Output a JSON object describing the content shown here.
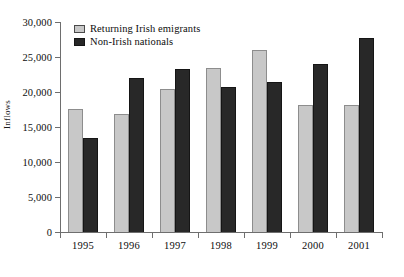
{
  "chart_data": {
    "type": "bar",
    "title": "",
    "subtitle": "",
    "xlabel": "",
    "ylabel": "Inflows",
    "categories": [
      "1995",
      "1996",
      "1997",
      "1998",
      "1999",
      "2000",
      "2001"
    ],
    "series": [
      {
        "name": "Returning Irish emigrants",
        "color": "#c8c8c8",
        "values": [
          17600,
          16900,
          20400,
          23400,
          26000,
          18100,
          18200
        ]
      },
      {
        "name": "Non-Irish nationals",
        "color": "#282828",
        "values": [
          13500,
          22000,
          23300,
          20700,
          21500,
          24000,
          27700
        ]
      }
    ],
    "ylim": [
      0,
      30000
    ],
    "ytick_values": [
      0,
      5000,
      10000,
      15000,
      20000,
      25000,
      30000
    ],
    "ytick_labels": [
      "0",
      "5,000",
      "10,000",
      "15,000",
      "20,000",
      "25,000",
      "30,000"
    ],
    "grid": false,
    "legend_position": "top-left-inside"
  }
}
